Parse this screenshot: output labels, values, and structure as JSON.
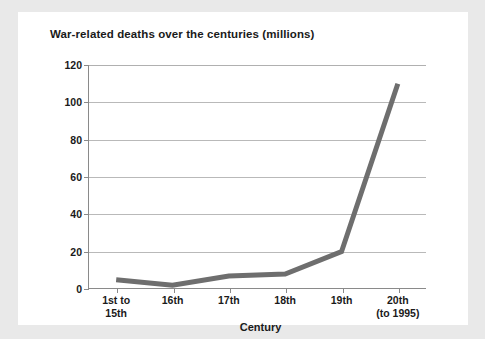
{
  "chart_data": {
    "type": "line",
    "title": "War-related deaths over the centuries (millions)",
    "xlabel": "Century",
    "ylabel": "",
    "categories": [
      "1st to 15th",
      "16th",
      "17th",
      "18th",
      "19th",
      "20th (to 1995)"
    ],
    "category_lines": [
      [
        "1st to",
        "15th"
      ],
      [
        "16th",
        ""
      ],
      [
        "17th",
        ""
      ],
      [
        "18th",
        ""
      ],
      [
        "19th",
        ""
      ],
      [
        "20th",
        "(to 1995)"
      ]
    ],
    "values": [
      5,
      2,
      7,
      8,
      20,
      110
    ],
    "ylim": [
      0,
      120
    ],
    "ytick_labels": [
      "120",
      "100",
      "80",
      "60",
      "40",
      "20",
      "0"
    ],
    "ytick_values": [
      120,
      100,
      80,
      60,
      40,
      20,
      0
    ],
    "grid": true,
    "legend": false,
    "series_color": "#6e6e6e",
    "axis_color": "#8a8a8a",
    "grid_color": "#b9b9b9",
    "card_background": "#ffffff",
    "page_background": "#e9e9e9",
    "text_color": "#1a1a1a"
  }
}
